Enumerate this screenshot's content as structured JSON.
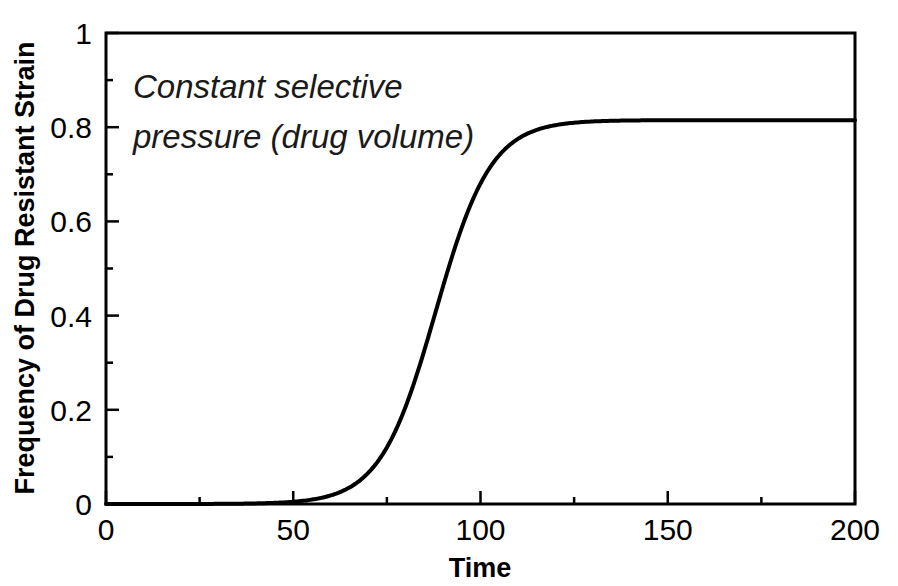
{
  "figure": {
    "background_color": "#ffffff",
    "foreground_color": "#000000",
    "annotation_line1": "Constant selective",
    "annotation_line2": "pressure (drug volume)"
  },
  "chart_data": {
    "type": "line",
    "title": "",
    "subtitle": "",
    "xlabel": "Time",
    "ylabel": "Frequency of Drug Resistant Strain",
    "xlim": [
      0,
      200
    ],
    "ylim": [
      0,
      1
    ],
    "grid": false,
    "legend": false,
    "legend_position": "none",
    "xticks": [
      0,
      50,
      100,
      150,
      200
    ],
    "xtick_labels": [
      "0",
      "50",
      "100",
      "150",
      "200"
    ],
    "xminor_step": 25,
    "yticks": [
      0,
      0.2,
      0.4,
      0.6,
      0.8,
      1
    ],
    "ytick_labels": [
      "0",
      "0.2",
      "0.4",
      "0.6",
      "0.8",
      "1"
    ],
    "yminor_step": 0.1,
    "line_color": "#000000",
    "line_width": 4,
    "annotations": [
      {
        "text": "Constant selective pressure (drug volume)",
        "x": 20,
        "y": 0.88,
        "style": "italic"
      }
    ],
    "series": [
      {
        "name": "Drug resistant strain frequency",
        "model": "logistic",
        "plateau": 0.815,
        "midpoint": 88,
        "growth_rate": 0.135,
        "x": [
          0,
          5,
          10,
          15,
          20,
          25,
          30,
          35,
          40,
          45,
          50,
          55,
          60,
          62,
          64,
          66,
          68,
          70,
          72,
          74,
          76,
          78,
          80,
          82,
          84,
          86,
          88,
          90,
          92,
          94,
          96,
          98,
          100,
          102,
          104,
          106,
          108,
          110,
          112,
          114,
          116,
          118,
          120,
          125,
          130,
          135,
          140,
          150,
          160,
          170,
          180,
          190,
          200
        ],
        "values": [
          0.0,
          0.0,
          0.0,
          0.0,
          0.001,
          0.001,
          0.002,
          0.004,
          0.007,
          0.014,
          0.026,
          0.005,
          0.009,
          0.012,
          0.015,
          0.02,
          0.026,
          0.033,
          0.043,
          0.055,
          0.07,
          0.089,
          0.112,
          0.139,
          0.171,
          0.208,
          0.25,
          0.296,
          0.345,
          0.396,
          0.447,
          0.497,
          0.544,
          0.587,
          0.626,
          0.66,
          0.69,
          0.715,
          0.736,
          0.753,
          0.767,
          0.778,
          0.787,
          0.8,
          0.807,
          0.811,
          0.813,
          0.815,
          0.815,
          0.815,
          0.815,
          0.815,
          0.815
        ]
      }
    ]
  }
}
